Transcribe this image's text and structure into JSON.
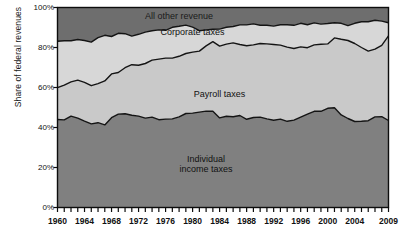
{
  "chart_data": {
    "type": "area",
    "stacked": true,
    "title": "",
    "subtitle": "",
    "xlabel": "",
    "ylabel": "Share of federal revenues",
    "xlim": [
      1960,
      2009
    ],
    "ylim": [
      0,
      100
    ],
    "y_unit": "%",
    "grid": false,
    "legend_position": "inline-annotations",
    "ytick_labels": [
      "100%",
      "80%",
      "60%",
      "40%",
      "20%",
      "0%"
    ],
    "ytick_values": [
      100,
      80,
      60,
      40,
      20,
      0
    ],
    "xtick_labels": [
      "1960",
      "1964",
      "1968",
      "1972",
      "1976",
      "1980",
      "1984",
      "1988",
      "1992",
      "1996",
      "2000",
      "2004",
      "2009"
    ],
    "xtick_values": [
      1960,
      1964,
      1968,
      1972,
      1976,
      1980,
      1984,
      1988,
      1992,
      1996,
      2000,
      2004,
      2009
    ],
    "x": [
      1960,
      1961,
      1962,
      1963,
      1964,
      1965,
      1966,
      1967,
      1968,
      1969,
      1970,
      1971,
      1972,
      1973,
      1974,
      1975,
      1976,
      1977,
      1978,
      1979,
      1980,
      1981,
      1982,
      1983,
      1984,
      1985,
      1986,
      1987,
      1988,
      1989,
      1990,
      1991,
      1992,
      1993,
      1994,
      1995,
      1996,
      1997,
      1998,
      1999,
      2000,
      2001,
      2002,
      2003,
      2004,
      2005,
      2006,
      2007,
      2008,
      2009
    ],
    "series": [
      {
        "name": "Individual income taxes",
        "label": "Individual\nincome taxes",
        "color": "#808080",
        "values": [
          44.0,
          43.8,
          45.7,
          44.7,
          43.2,
          41.8,
          42.4,
          41.3,
          44.9,
          46.7,
          46.9,
          46.1,
          45.7,
          44.7,
          45.2,
          43.9,
          44.2,
          44.3,
          45.3,
          47.0,
          47.2,
          47.7,
          48.2,
          48.1,
          44.8,
          45.6,
          45.4,
          46.0,
          44.1,
          45.0,
          45.2,
          44.3,
          43.6,
          44.2,
          43.1,
          43.7,
          45.2,
          46.7,
          48.1,
          48.1,
          49.6,
          49.9,
          46.3,
          44.5,
          43.0,
          43.1,
          43.4,
          45.3,
          45.4,
          43.5
        ],
        "area_label_x": 1982,
        "area_label_y": 22
      },
      {
        "name": "Payroll taxes",
        "label": "Payroll taxes",
        "color": "#c9c9c9",
        "values": [
          15.9,
          17.4,
          17.1,
          19.0,
          19.4,
          19.1,
          19.5,
          22.0,
          21.9,
          20.8,
          23.0,
          25.3,
          25.4,
          27.3,
          28.5,
          30.3,
          30.5,
          30.4,
          30.3,
          30.0,
          30.5,
          30.5,
          32.6,
          34.8,
          35.9,
          36.1,
          36.9,
          35.5,
          36.8,
          36.3,
          36.8,
          37.5,
          37.9,
          37.0,
          37.1,
          35.8,
          35.1,
          33.2,
          33.2,
          33.5,
          32.2,
          34.9,
          37.8,
          39.0,
          39.0,
          36.9,
          34.8,
          33.9,
          35.7,
          42.3
        ],
        "area_label_x": 1984,
        "area_label_y": 57
      },
      {
        "name": "Corporate taxes",
        "label": "Corporate taxes",
        "color": "#d7d7d7",
        "values": [
          23.2,
          22.2,
          20.6,
          20.3,
          20.9,
          21.8,
          23.0,
          22.8,
          18.7,
          19.6,
          17.0,
          14.3,
          15.5,
          15.7,
          14.7,
          14.6,
          13.9,
          15.4,
          15.0,
          14.2,
          12.5,
          10.2,
          8.0,
          6.2,
          8.5,
          8.4,
          8.2,
          9.8,
          10.4,
          10.5,
          9.1,
          9.3,
          9.2,
          10.2,
          11.2,
          11.6,
          11.8,
          11.5,
          11.0,
          10.1,
          10.2,
          7.6,
          8.0,
          7.4,
          10.1,
          12.9,
          14.7,
          14.4,
          12.1,
          6.6
        ],
        "area_label_x": 1980,
        "area_label_y": 88
      },
      {
        "name": "All other revenue",
        "label": "All other revenue",
        "color": "#6e6e6e",
        "values": [
          16.9,
          16.6,
          16.6,
          16.0,
          16.5,
          17.3,
          15.1,
          13.9,
          14.5,
          12.9,
          13.1,
          14.3,
          13.4,
          12.3,
          11.6,
          11.2,
          11.4,
          9.9,
          9.4,
          8.8,
          9.8,
          11.6,
          11.2,
          10.9,
          10.8,
          9.9,
          9.5,
          8.7,
          8.7,
          8.2,
          8.9,
          8.9,
          9.3,
          8.6,
          8.6,
          8.9,
          7.9,
          8.6,
          7.7,
          8.3,
          8.0,
          7.6,
          7.9,
          9.1,
          7.9,
          7.1,
          7.1,
          6.4,
          6.8,
          7.6
        ],
        "area_label_x": 1978,
        "area_label_y": 96
      }
    ]
  },
  "axis": {
    "y_title": "Share of federal revenues"
  }
}
